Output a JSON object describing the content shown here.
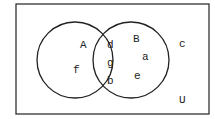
{
  "diagram": {
    "type": "venn",
    "universe_label": "U",
    "sets": [
      {
        "name": "A",
        "label": "A"
      },
      {
        "name": "B",
        "label": "B"
      }
    ],
    "regions": {
      "A_only": [
        "f"
      ],
      "A_and_B": [
        "d",
        "g",
        "b"
      ],
      "B_only": [
        "a",
        "e"
      ],
      "outside": [
        "c"
      ]
    },
    "labels": {
      "A": "A",
      "B": "B",
      "U": "U",
      "f": "f",
      "d": "d",
      "g": "g",
      "b": "b",
      "a": "a",
      "e": "e",
      "c": "c"
    },
    "colors": {
      "stroke": "#222222",
      "background": "#ffffff"
    }
  }
}
